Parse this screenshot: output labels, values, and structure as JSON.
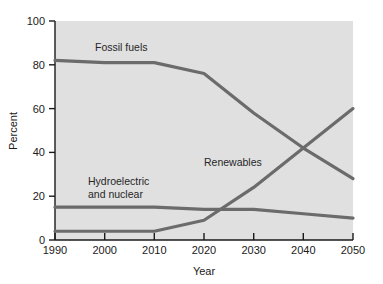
{
  "chart_data": {
    "type": "line",
    "title": "",
    "xlabel": "Year",
    "ylabel": "Percent",
    "xlim": [
      1990,
      2050
    ],
    "ylim": [
      0,
      100
    ],
    "xticks": [
      1990,
      2000,
      2010,
      2020,
      2030,
      2040,
      2050
    ],
    "yticks": [
      0,
      20,
      40,
      60,
      80,
      100
    ],
    "grid": false,
    "legend": "inline-labels",
    "x": [
      1990,
      2000,
      2010,
      2020,
      2030,
      2040,
      2050
    ],
    "series": [
      {
        "name": "Fossil fuels",
        "color": "#6b6b6b",
        "values": [
          82,
          81,
          81,
          76,
          58,
          42,
          28
        ],
        "label_x": 2012,
        "label_y": 90
      },
      {
        "name": "Renewables",
        "color": "#6b6b6b",
        "values": [
          4,
          4,
          4,
          9,
          24,
          42,
          60
        ],
        "label_x": 2029,
        "label_y": 35
      },
      {
        "name": "Hydroelectric and nuclear",
        "color": "#6b6b6b",
        "values": [
          15,
          15,
          15,
          14,
          14,
          12,
          10
        ],
        "label_line1": "Hydroelectric",
        "label_line2": "and nuclear",
        "label_x": 2000,
        "label_y": 25
      }
    ],
    "annotations": [
      {
        "text": "Fossil fuels",
        "x": 2012,
        "y": 90
      },
      {
        "text": "Renewables",
        "x": 2029,
        "y": 35
      },
      {
        "text": "Hydroelectric",
        "x": 2000,
        "y": 27
      },
      {
        "text": "and nuclear",
        "x": 2000,
        "y": 21
      }
    ]
  },
  "axes": {
    "y_tick_labels": [
      "100",
      "80",
      "60",
      "40",
      "20",
      "0"
    ],
    "x_tick_labels": [
      "1990",
      "2000",
      "2010",
      "2020",
      "2030",
      "2040",
      "2050"
    ],
    "x_axis_title": "Year",
    "y_axis_title": "Percent"
  },
  "labels": {
    "fossil_fuels": "Fossil fuels",
    "renewables": "Renewables",
    "hydro_line1": "Hydroelectric",
    "hydro_line2": "and nuclear"
  },
  "colors": {
    "plot_background": "#e0e0e0",
    "line": "#6b6b6b",
    "axis": "#1a1a1a",
    "text": "#1a1a1a",
    "page_background": "#ffffff"
  }
}
